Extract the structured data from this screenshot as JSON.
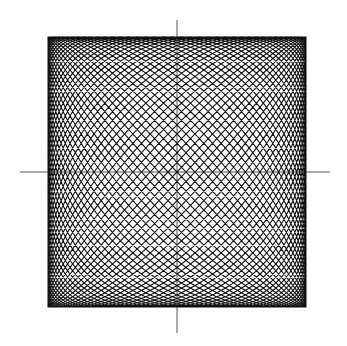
{
  "chart_data": {
    "type": "line",
    "title": "",
    "xlabel": "",
    "ylabel": "",
    "grid": false,
    "legend": null,
    "canvas": {
      "width": 347,
      "height": 346
    },
    "center": [
      177,
      172
    ],
    "axes": {
      "horizontal": {
        "x1": 20,
        "x2": 330,
        "y": 172
      },
      "vertical": {
        "x": 177,
        "y1": 20,
        "y2": 333
      }
    },
    "envelope": {
      "left": 50,
      "right": 308,
      "top": 37,
      "bottom": 307
    },
    "params": {
      "amplitude_x": 129,
      "amplitude_y": 135,
      "phase_cycles": 1,
      "oscillations": 44,
      "samples": 9000
    },
    "colors": {
      "curve": "#111111",
      "axis": "#555555",
      "background": "#ffffff"
    }
  }
}
